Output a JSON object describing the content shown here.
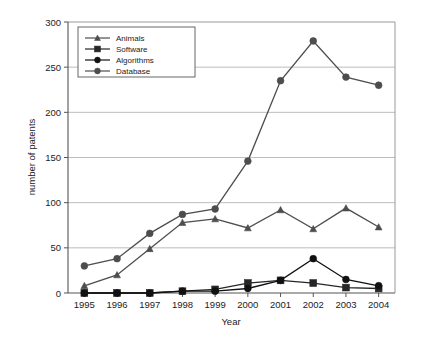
{
  "chart_data": {
    "type": "line",
    "title": "",
    "xlabel": "Year",
    "ylabel": "number of patents",
    "categories": [
      "1995",
      "1996",
      "1997",
      "1998",
      "1999",
      "2000",
      "2001",
      "2002",
      "2003",
      "2004"
    ],
    "x": [
      1995,
      1996,
      1997,
      1998,
      1999,
      2000,
      2001,
      2002,
      2003,
      2004
    ],
    "ylim": [
      0,
      300
    ],
    "yticks": [
      0,
      50,
      100,
      150,
      200,
      250,
      300
    ],
    "ytick_labels": [
      "0",
      "50",
      "100",
      "150",
      "200",
      "250",
      "300"
    ],
    "grid": "horizontal",
    "legend_position": "top-left",
    "series": [
      {
        "name": "Animals",
        "marker": "triangle",
        "color": "#4d4d4d",
        "values": [
          8,
          20,
          49,
          78,
          82,
          72,
          92,
          71,
          94,
          73
        ]
      },
      {
        "name": "Software",
        "marker": "square",
        "color": "#262626",
        "values": [
          0,
          0,
          0,
          2,
          4,
          11,
          14,
          11,
          6,
          5
        ]
      },
      {
        "name": "Algorithms",
        "marker": "circle",
        "color": "#111111",
        "values": [
          0,
          0,
          0,
          2,
          2,
          5,
          14,
          38,
          15,
          8
        ]
      },
      {
        "name": "Database",
        "marker": "circle",
        "color": "#4d4d4d",
        "values": [
          30,
          38,
          66,
          87,
          93,
          146,
          235,
          279,
          239,
          230
        ]
      }
    ]
  },
  "axes": {
    "y_axis_title": "number of patents",
    "x_axis_title": "Year"
  },
  "legend": {
    "items": [
      {
        "label": "Animals"
      },
      {
        "label": "Software"
      },
      {
        "label": "Algorithms"
      },
      {
        "label": "Database"
      }
    ]
  }
}
